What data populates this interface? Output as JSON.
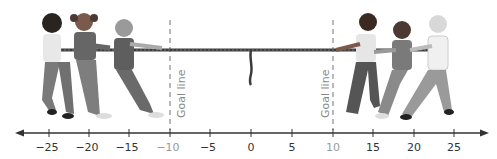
{
  "figure": {
    "left_team_count": 3,
    "right_team_count": 3
  },
  "goal_lines": [
    {
      "label": "Goal line",
      "value": -10
    },
    {
      "label": "Goal line",
      "value": 10
    }
  ],
  "number_line": {
    "min": -25,
    "max": 25,
    "step": 5,
    "ticks": [
      {
        "value": -25,
        "label": "−25"
      },
      {
        "value": -20,
        "label": "−20"
      },
      {
        "value": -15,
        "label": "−15"
      },
      {
        "value": -10,
        "label": "−10"
      },
      {
        "value": -5,
        "label": "−5"
      },
      {
        "value": 0,
        "label": "0"
      },
      {
        "value": 5,
        "label": "5"
      },
      {
        "value": 10,
        "label": "10"
      },
      {
        "value": 15,
        "label": "15"
      },
      {
        "value": 20,
        "label": "20"
      },
      {
        "value": 25,
        "label": "25"
      }
    ],
    "arrows": "both"
  },
  "rope": {
    "marker_position": 0
  },
  "colors": {
    "axis": "#333333",
    "goal_line": "#8a8a8a",
    "rope": "#3c3c3c",
    "skin_dark": "#3a2a22",
    "clothing": "#6e6e6e"
  }
}
